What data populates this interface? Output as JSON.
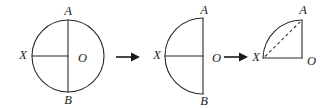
{
  "figure": {
    "background_color": "#ffffff",
    "stroke_color": "#2b2b2b",
    "dashed_color": "#3a3a3a",
    "arrow_color": "#1a1a1a",
    "label_color": "#1c1c1c"
  },
  "panels": [
    {
      "id": "panel-circle",
      "shape": "full-circle",
      "description": "Full circle with center O, vertical diameter A to B, horizontal radius X to O",
      "center": {
        "x": 68,
        "y": 56
      },
      "radius": 36,
      "labels": {
        "top": "A",
        "bottom": "B",
        "left": "X",
        "center": "O"
      },
      "label_positions": {
        "top": {
          "x": 68,
          "y": 12
        },
        "bottom": {
          "x": 68,
          "y": 100
        },
        "left": {
          "x": 24,
          "y": 56
        },
        "center": {
          "x": 78,
          "y": 58
        }
      }
    },
    {
      "id": "panel-semicircle",
      "shape": "left-half-semicircle",
      "description": "Semicircle bulging left, straight vertical edge A-B on right, horizontal radius X to O",
      "center": {
        "x": 203,
        "y": 56
      },
      "radius": 38,
      "labels": {
        "top": "A",
        "bottom": "B",
        "left": "X",
        "center": "O"
      },
      "label_positions": {
        "top": {
          "x": 204,
          "y": 12
        },
        "bottom": {
          "x": 204,
          "y": 100
        },
        "left": {
          "x": 158,
          "y": 56
        },
        "center": {
          "x": 212,
          "y": 58
        }
      }
    },
    {
      "id": "panel-quarter",
      "shape": "quarter-circle",
      "description": "Quarter circle: right angle at O, arc from X to A, dashed chord from X to A",
      "corner_o": {
        "x": 302,
        "y": 58
      },
      "corner_x": {
        "x": 263,
        "y": 58
      },
      "corner_a": {
        "x": 302,
        "y": 20
      },
      "labels": {
        "top": "A",
        "left": "X",
        "corner": "O"
      },
      "label_positions": {
        "top": {
          "x": 303,
          "y": 11
        },
        "left": {
          "x": 256,
          "y": 58
        },
        "corner": {
          "x": 311,
          "y": 60
        }
      },
      "dashed_chord": {
        "from": "X",
        "to": "A"
      }
    }
  ],
  "arrows": [
    {
      "id": "arrow-1",
      "name": "transform-arrow-1",
      "from_panel": "panel-circle",
      "to_panel": "panel-semicircle",
      "x1": 116,
      "x2": 138,
      "y": 57
    },
    {
      "id": "arrow-2",
      "name": "transform-arrow-2",
      "from_panel": "panel-semicircle",
      "to_panel": "panel-quarter",
      "x1": 224,
      "x2": 246,
      "y": 57
    }
  ]
}
